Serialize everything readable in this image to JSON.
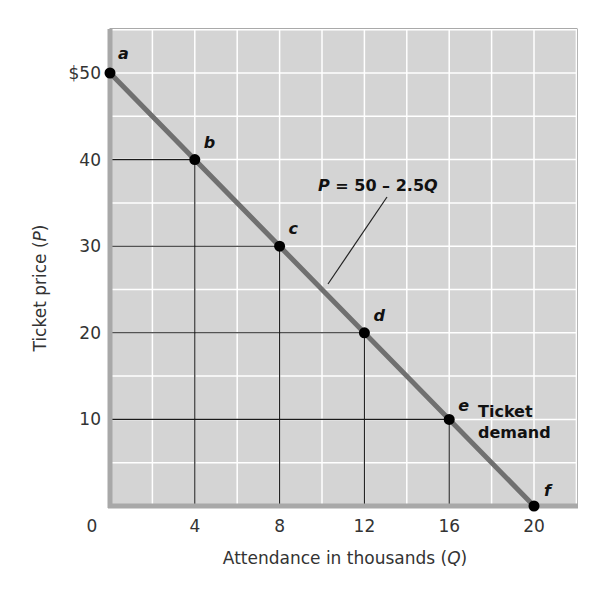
{
  "chart_data": {
    "type": "line",
    "title": "",
    "xlabel": "Attendance in thousands",
    "xlabel_var": "Q",
    "ylabel": "Ticket price",
    "ylabel_var": "P",
    "xlim": [
      0,
      22
    ],
    "ylim": [
      0,
      55
    ],
    "x_ticks": [
      0,
      4,
      8,
      12,
      16,
      20
    ],
    "x_tick_labels": [
      "0",
      "4",
      "8",
      "12",
      "16",
      "20"
    ],
    "y_ticks": [
      10,
      20,
      30,
      40,
      50
    ],
    "y_tick_labels": [
      "10",
      "20",
      "30",
      "40",
      "$50"
    ],
    "grid": {
      "on": true,
      "x_step": 2,
      "y_step": 5,
      "color": "#ffffff"
    },
    "series": [
      {
        "name": "Ticket demand",
        "equation": "P = 50 – 2.5Q",
        "equation_parts": {
          "var": "P",
          "rest_a": " = 50 – 2.5",
          "var2": "Q"
        },
        "points": [
          {
            "label": "a",
            "x": 0,
            "y": 50
          },
          {
            "label": "b",
            "x": 4,
            "y": 40
          },
          {
            "label": "c",
            "x": 8,
            "y": 30
          },
          {
            "label": "d",
            "x": 12,
            "y": 20
          },
          {
            "label": "e",
            "x": 16,
            "y": 10
          },
          {
            "label": "f",
            "x": 20,
            "y": 0
          }
        ]
      }
    ],
    "annotations": [
      {
        "text": "P = 50 – 2.5Q",
        "points_to": "demand curve"
      },
      {
        "text": "Ticket demand",
        "near_point": "e"
      }
    ],
    "curve_label_lines": [
      "Ticket",
      "demand"
    ],
    "colors": {
      "plot_background": "#d4d4d4",
      "curve": "#707070",
      "axis": "#a8a8a8",
      "reference_lines": "#1a1a1a",
      "points": "#000000"
    }
  }
}
